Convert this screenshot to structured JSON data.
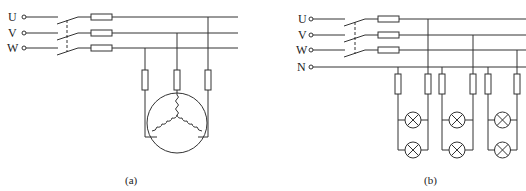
{
  "figure": {
    "panel_a": {
      "caption": "(a)",
      "description": "Three-phase motor with switch and fuses (star-connected windings)",
      "phase_labels": [
        "U",
        "V",
        "W"
      ],
      "components": [
        "three-pole switch",
        "line fuses x3",
        "branch fuses x3",
        "three-phase motor (Y winding)"
      ]
    },
    "panel_b": {
      "caption": "(b)",
      "description": "Three-phase four-wire lighting circuit with fused lamp groups",
      "phase_labels": [
        "U",
        "V",
        "W",
        "N"
      ],
      "components": [
        "three-pole switch",
        "line fuses x3",
        "branch fuses x6",
        "lamps x6 (3 groups of 2 in parallel)"
      ]
    }
  },
  "colors": {
    "line": "#333333",
    "background": "#ffffff"
  }
}
